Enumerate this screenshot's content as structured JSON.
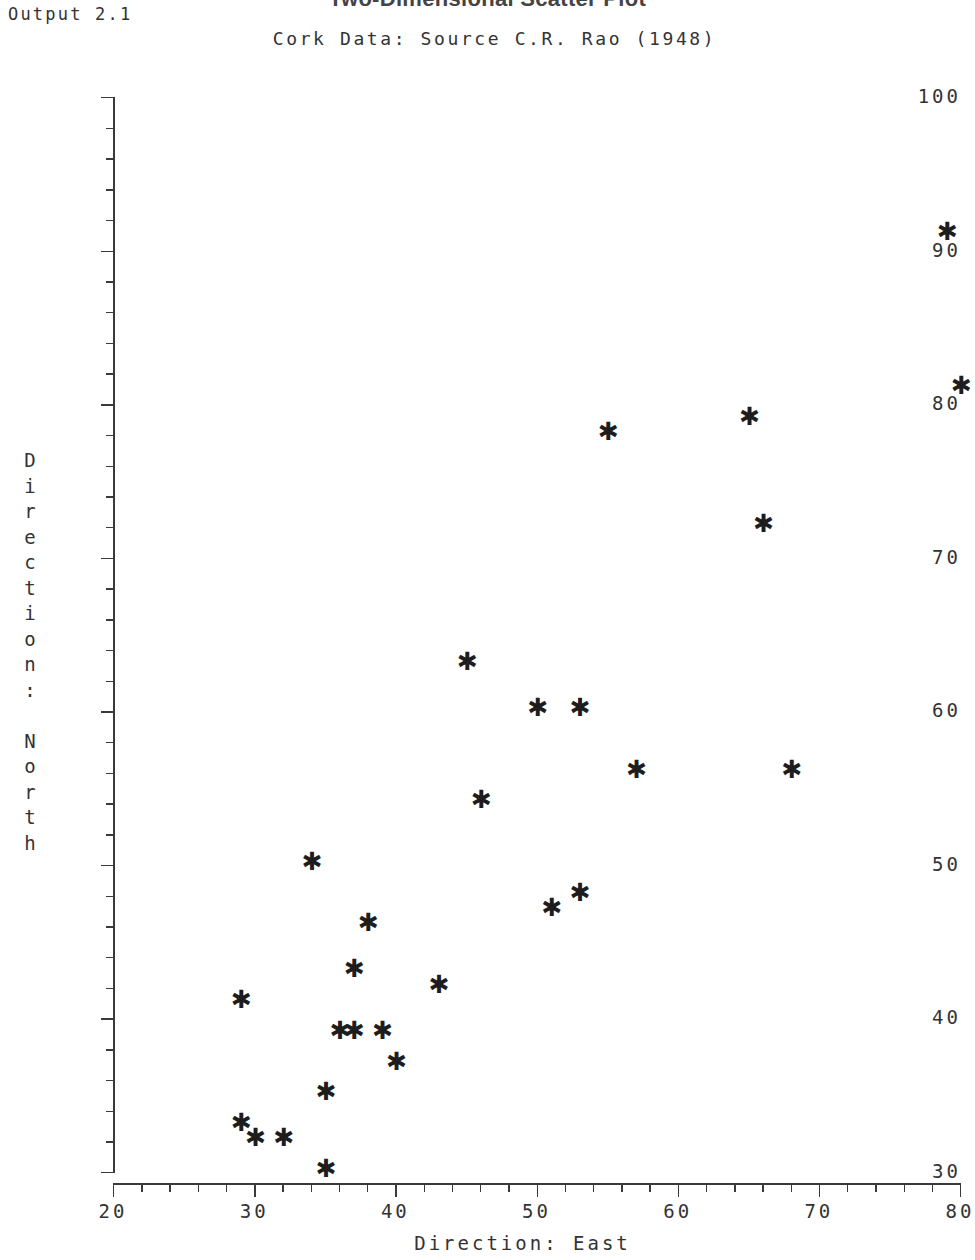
{
  "output_label": "Output 2.1",
  "title": "Two-Dimensional Scatter Plot",
  "subtitle": "Cork Data: Source C.R. Rao (1948)",
  "axes": {
    "x_title": "Direction: East",
    "y_title": "Direction: North",
    "y_title_chars": [
      "D",
      "i",
      "r",
      "e",
      "c",
      "t",
      "i",
      "o",
      "n",
      ":",
      "",
      "N",
      "o",
      "r",
      "t",
      "h"
    ],
    "x_ticks": [
      20,
      30,
      40,
      50,
      60,
      70,
      80
    ],
    "y_ticks": [
      30,
      40,
      50,
      60,
      70,
      80,
      90,
      100
    ],
    "x_minor_step": 2,
    "y_minor_step": 2
  },
  "chart_data": {
    "type": "scatter",
    "title": "Two-Dimensional Scatter Plot",
    "subtitle": "Cork Data: Source C.R. Rao (1948)",
    "xlabel": "Direction: East",
    "ylabel": "Direction: North",
    "xlim": [
      20,
      80
    ],
    "ylim": [
      30,
      100
    ],
    "grid": false,
    "legend": false,
    "marker": "asterisk",
    "marker_glyph": "✱",
    "marker_color": "#1d1d1d",
    "points": [
      {
        "x": 29,
        "y": 41
      },
      {
        "x": 29,
        "y": 33
      },
      {
        "x": 30,
        "y": 32
      },
      {
        "x": 32,
        "y": 32
      },
      {
        "x": 34,
        "y": 50
      },
      {
        "x": 35,
        "y": 30
      },
      {
        "x": 35,
        "y": 35
      },
      {
        "x": 36,
        "y": 39
      },
      {
        "x": 37,
        "y": 39
      },
      {
        "x": 37,
        "y": 43
      },
      {
        "x": 38,
        "y": 46
      },
      {
        "x": 39,
        "y": 39
      },
      {
        "x": 40,
        "y": 37
      },
      {
        "x": 43,
        "y": 42
      },
      {
        "x": 45,
        "y": 63
      },
      {
        "x": 46,
        "y": 54
      },
      {
        "x": 50,
        "y": 60
      },
      {
        "x": 51,
        "y": 47
      },
      {
        "x": 53,
        "y": 60
      },
      {
        "x": 53,
        "y": 48
      },
      {
        "x": 55,
        "y": 78
      },
      {
        "x": 57,
        "y": 56
      },
      {
        "x": 65,
        "y": 79
      },
      {
        "x": 66,
        "y": 72
      },
      {
        "x": 68,
        "y": 56
      },
      {
        "x": 79,
        "y": 91
      },
      {
        "x": 80,
        "y": 81
      }
    ]
  },
  "colors": {
    "axis": "#3a3a3a",
    "text": "#333333",
    "marker": "#1d1d1d",
    "background": "#ffffff"
  }
}
